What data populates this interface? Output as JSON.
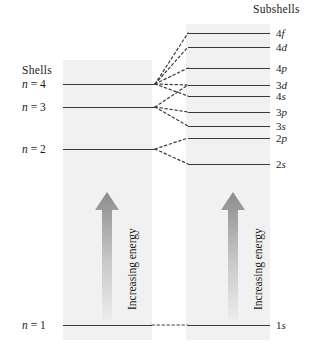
{
  "diagram": {
    "headings": {
      "shells": "Shells",
      "subshells": "Subshells"
    },
    "arrow_label_left": "Increasing energy",
    "arrow_label_right": "Increasing energy",
    "shells": [
      {
        "label_n": "n",
        "label_eq": "=",
        "label_value": "4",
        "full": "n = 4",
        "y": 84
      },
      {
        "label_n": "n",
        "label_eq": "=",
        "label_value": "3",
        "full": "n = 3",
        "y": 107
      },
      {
        "label_n": "n",
        "label_eq": "=",
        "label_value": "2",
        "full": "n = 2",
        "y": 149
      },
      {
        "label_n": "n",
        "label_eq": "=",
        "label_value": "1",
        "full": "n = 1",
        "y": 325
      }
    ],
    "subshells": [
      {
        "principal": "4",
        "orbital": "f",
        "label": "4f",
        "y": 33
      },
      {
        "principal": "4",
        "orbital": "d",
        "label": "4d",
        "y": 47
      },
      {
        "principal": "4",
        "orbital": "p",
        "label": "4p",
        "y": 68
      },
      {
        "principal": "3",
        "orbital": "d",
        "label": "3d",
        "y": 85
      },
      {
        "principal": "4",
        "orbital": "s",
        "label": "4s",
        "y": 96
      },
      {
        "principal": "3",
        "orbital": "p",
        "label": "3p",
        "y": 112
      },
      {
        "principal": "3",
        "orbital": "s",
        "label": "3s",
        "y": 126
      },
      {
        "principal": "2",
        "orbital": "p",
        "label": "2p",
        "y": 138
      },
      {
        "principal": "2",
        "orbital": "s",
        "label": "2s",
        "y": 164
      },
      {
        "principal": "1",
        "orbital": "s",
        "label": "1s",
        "y": 325
      }
    ],
    "colors": {
      "panel_fill": "#f1f1f1",
      "level_line": "#3a3a3a",
      "dashed_line": "#3a3a3a",
      "arrow_dark": "#8c8c8c",
      "arrow_light": "#e2e2e2",
      "text": "#1a1a1a",
      "background": "#ffffff"
    }
  }
}
